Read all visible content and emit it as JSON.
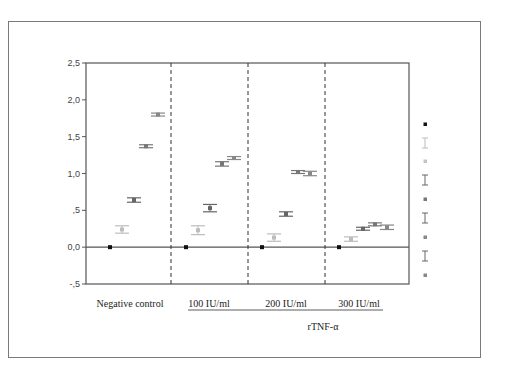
{
  "chart_data": {
    "type": "scatter",
    "title": "",
    "xlabel": "rTNF-α",
    "ylabel": "",
    "ylim": [
      -0.5,
      2.5
    ],
    "yticks": [
      "-,5",
      "0,0",
      ",5",
      "1,0",
      "1,5",
      "2,0",
      "2,5"
    ],
    "ytick_values": [
      -0.5,
      0.0,
      0.5,
      1.0,
      1.5,
      2.0,
      2.5
    ],
    "grid": false,
    "legend_position": "right",
    "categories": [
      "Negative control",
      "100 IU/ml",
      "200 IU/ml",
      "300 IU/ml"
    ],
    "group_label": "rTNF-α",
    "series": [
      {
        "name": "series-1",
        "color": "#111111",
        "values": [
          0.0,
          0.0,
          0.0,
          0.0
        ],
        "errors": [
          0.0,
          0.0,
          0.0,
          0.0
        ]
      },
      {
        "name": "series-2",
        "color": "#bdbdbd",
        "values": [
          0.24,
          0.23,
          0.13,
          0.11
        ],
        "errors": [
          0.05,
          0.06,
          0.05,
          0.03
        ]
      },
      {
        "name": "series-3",
        "color": "#666666",
        "values": [
          0.64,
          0.53,
          0.45,
          0.25
        ],
        "errors": [
          0.03,
          0.05,
          0.03,
          0.02
        ]
      },
      {
        "name": "series-4",
        "color": "#777777",
        "values": [
          1.37,
          1.13,
          1.02,
          0.31
        ],
        "errors": [
          0.02,
          0.03,
          0.02,
          0.02
        ]
      },
      {
        "name": "series-5",
        "color": "#888888",
        "values": [
          1.8,
          1.21,
          1.0,
          0.27
        ],
        "errors": [
          0.02,
          0.02,
          0.03,
          0.03
        ]
      }
    ],
    "legend": [
      {
        "type": "marker",
        "color": "#111111"
      },
      {
        "type": "errorbar",
        "color": "#bdbdbd"
      },
      {
        "type": "marker",
        "color": "#c4c4c4"
      },
      {
        "type": "errorbar",
        "color": "#666666"
      },
      {
        "type": "marker",
        "color": "#777777"
      },
      {
        "type": "errorbar",
        "color": "#666666"
      },
      {
        "type": "marker",
        "color": "#888888"
      },
      {
        "type": "errorbar",
        "color": "#666666"
      },
      {
        "type": "marker",
        "color": "#888888"
      }
    ]
  }
}
